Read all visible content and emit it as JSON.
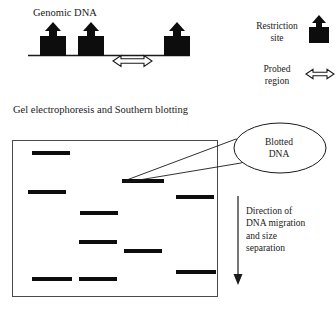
{
  "figure": {
    "width": 335,
    "height": 311,
    "background": "#ffffff",
    "ink": "#000000",
    "line_color": "#1a1a1a"
  },
  "panels": {
    "genomic": {
      "title": "Genomic DNA",
      "backbone": {
        "x1": 28,
        "x2": 190,
        "y": 55
      },
      "restriction_sites": [
        {
          "name": "restriction-site-1",
          "x": 40,
          "y": 33,
          "width": 26,
          "height": 22
        },
        {
          "name": "restriction-site-2",
          "x": 78,
          "y": 33,
          "width": 26,
          "height": 22
        },
        {
          "name": "restriction-site-3",
          "x": 164,
          "y": 33,
          "width": 26,
          "height": 22
        }
      ],
      "probed_region": {
        "x1": 113,
        "x2": 152,
        "y": 61
      }
    },
    "gel": {
      "title": "Gel electrophoresis and Southern blotting",
      "box": {
        "x": 12,
        "y": 140,
        "width": 206,
        "height": 157
      },
      "lanes": [
        {
          "lane": 1,
          "bands": [
            {
              "x": 32,
              "y": 152,
              "width": 38
            },
            {
              "x": 28,
              "y": 191,
              "width": 38
            },
            {
              "x": 32,
              "y": 278,
              "width": 38
            }
          ]
        },
        {
          "lane": 2,
          "bands": [
            {
              "x": 80,
              "y": 212,
              "width": 38
            },
            {
              "x": 79,
              "y": 241,
              "width": 38
            },
            {
              "x": 79,
              "y": 278,
              "width": 38
            }
          ]
        },
        {
          "lane": 3,
          "bands": [
            {
              "x": 122,
              "y": 182,
              "width": 42
            },
            {
              "x": 124,
              "y": 250,
              "width": 38
            }
          ]
        },
        {
          "lane": 4,
          "bands": [
            {
              "x": 176,
              "y": 196,
              "width": 38
            },
            {
              "x": 176,
              "y": 271,
              "width": 38
            }
          ]
        }
      ],
      "band_height": 4
    }
  },
  "legend": {
    "restriction": {
      "label": "Restriction\nsite",
      "line1": "Restriction",
      "line2": "site"
    },
    "probed": {
      "label": "Probed\nregion",
      "line1": "Probed",
      "line2": "region"
    }
  },
  "annotations": {
    "blotted_dna": {
      "text": "Blotted\nDNA",
      "line1": "Blotted",
      "line2": "DNA",
      "ellipse": {
        "cx": 279,
        "cy": 148,
        "rx": 46,
        "ry": 25
      },
      "leader_target": {
        "x": 124,
        "y": 181
      }
    },
    "migration": {
      "text": "Direction of DNA migration and size separation",
      "line1": "Direction of",
      "line2": "DNA migration",
      "line3": "and size",
      "line4": "separation",
      "arrow": {
        "x": 238,
        "y1": 196,
        "y2": 284
      }
    }
  },
  "icons": {
    "restriction_site": "restriction-site-icon",
    "probed_region": "double-arrow-icon",
    "migration": "down-arrow-icon",
    "callout": "ellipse-callout-icon"
  }
}
